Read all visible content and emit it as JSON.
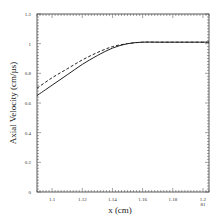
{
  "chart_data": {
    "type": "line",
    "title": "",
    "xlabel": "x (cm)",
    "ylabel": "Axial Velocity (cm/µs)",
    "xlim": [
      1.09,
      1.204
    ],
    "ylim": [
      0,
      1.2
    ],
    "x_ticks": [
      "1.1",
      "1.12",
      "1.14",
      "1.16",
      "1.18",
      "1.2"
    ],
    "y_ticks": [
      "0",
      "0.2",
      "0.4",
      "0.6",
      "0.8",
      "1",
      "1.2"
    ],
    "corner_annotation": "81",
    "grid": false,
    "legend": null,
    "series": [
      {
        "name": "solid",
        "style": "solid",
        "x": [
          1.09,
          1.1,
          1.11,
          1.12,
          1.13,
          1.14,
          1.15,
          1.16,
          1.17,
          1.18,
          1.19,
          1.204
        ],
        "y": [
          0.65,
          0.72,
          0.79,
          0.86,
          0.92,
          0.97,
          1.0,
          1.01,
          1.01,
          1.01,
          1.01,
          1.01
        ]
      },
      {
        "name": "dashed",
        "style": "dashed",
        "x": [
          1.09,
          1.1,
          1.11,
          1.12,
          1.13,
          1.14,
          1.15,
          1.16,
          1.17,
          1.18,
          1.19,
          1.204
        ],
        "y": [
          0.7,
          0.77,
          0.83,
          0.89,
          0.94,
          0.98,
          1.0,
          1.01,
          1.01,
          1.01,
          1.01,
          1.01
        ]
      }
    ]
  }
}
